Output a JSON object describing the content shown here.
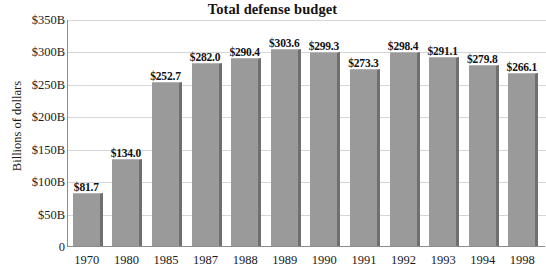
{
  "chart_data": {
    "type": "bar",
    "title": "Total defense budget",
    "xlabel": "",
    "ylabel": "Billions of dollars",
    "categories": [
      "1970",
      "1980",
      "1985",
      "1987",
      "1988",
      "1989",
      "1990",
      "1991",
      "1992",
      "1993",
      "1994",
      "1998"
    ],
    "values": [
      81.7,
      134.0,
      252.7,
      282.0,
      290.4,
      303.6,
      299.3,
      273.3,
      298.4,
      291.1,
      279.8,
      266.1
    ],
    "data_labels": [
      "$81.7",
      "$134.0",
      "$252.7",
      "$282.0",
      "$290.4",
      "$303.6",
      "$299.3",
      "$273.3",
      "$298.4",
      "$291.1",
      "$279.8",
      "$266.1"
    ],
    "ylim": [
      0,
      350
    ],
    "ytick_values": [
      350,
      300,
      250,
      200,
      150,
      100,
      50,
      0
    ],
    "ytick_labels": [
      "$350B",
      "$300B",
      "$250B",
      "$200B",
      "$150B",
      "$100B",
      "$50B",
      "0"
    ],
    "grid": true,
    "legend": false,
    "legend_position": "none",
    "bar_color": "#9a9a9a",
    "bar_shadow_color": "#6f6f6f",
    "gridline_color": "#d6d6d6",
    "axis_color": "#8c8c8c"
  }
}
